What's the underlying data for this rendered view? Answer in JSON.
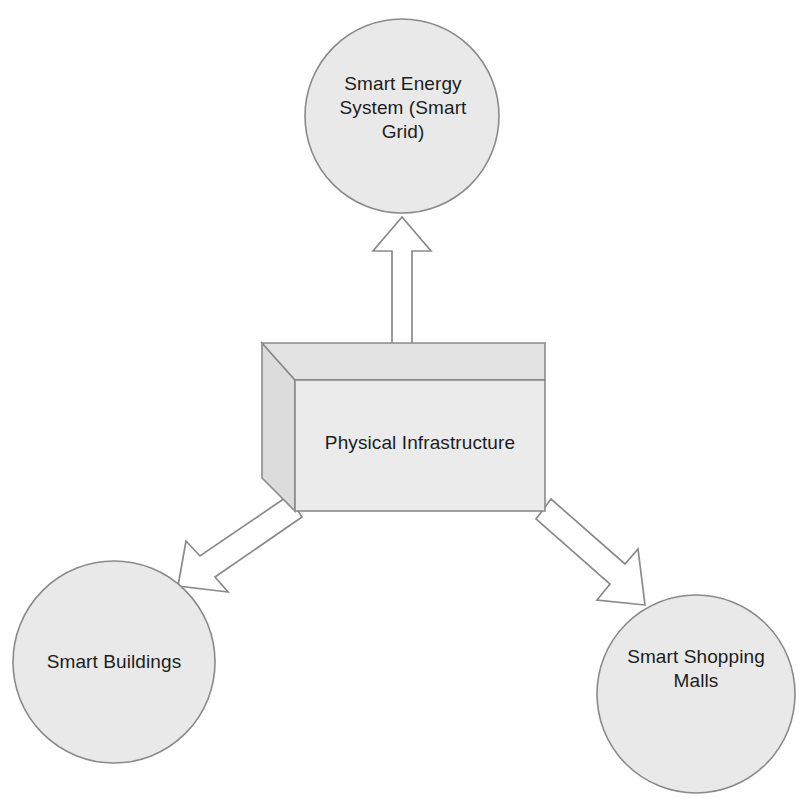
{
  "diagram": {
    "type": "block-arrow-node-diagram",
    "background_color": "#ffffff",
    "shape_fill_color": "#e9e9e9",
    "shape_stroke_color": "#8a8a8a",
    "arrow_fill_color": "#ffffff",
    "text_color": "#1d1d1d",
    "nodes": [
      {
        "id": "smart-energy-system",
        "shape": "circle",
        "label": "Smart Energy\nSystem (Smart\nGrid)",
        "position": "top-center"
      },
      {
        "id": "physical-infrastructure",
        "shape": "cube-3d",
        "label": "Physical Infrastructure",
        "position": "center"
      },
      {
        "id": "smart-buildings",
        "shape": "circle",
        "label": "Smart Buildings",
        "position": "bottom-left"
      },
      {
        "id": "smart-shopping-malls",
        "shape": "circle",
        "label": "Smart Shopping\nMalls",
        "position": "bottom-right"
      }
    ],
    "connectors": [
      {
        "id": "infra-to-energy",
        "style": "hollow-block-arrow",
        "from": "physical-infrastructure",
        "to": "smart-energy-system",
        "direction": "up"
      },
      {
        "id": "infra-to-buildings",
        "style": "hollow-block-arrow",
        "from": "physical-infrastructure",
        "to": "smart-buildings",
        "direction": "down-left"
      },
      {
        "id": "infra-to-malls",
        "style": "hollow-block-arrow",
        "from": "physical-infrastructure",
        "to": "smart-shopping-malls",
        "direction": "down-right"
      }
    ]
  }
}
